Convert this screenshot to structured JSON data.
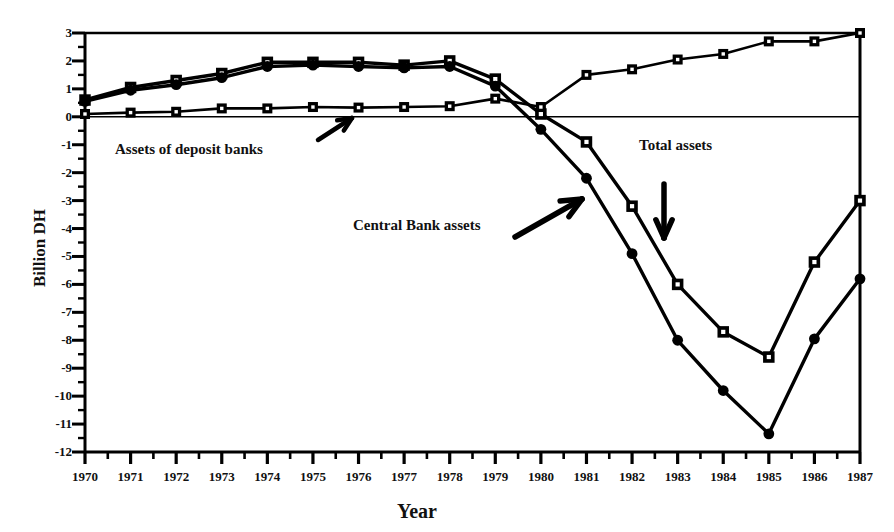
{
  "chart_data": {
    "type": "line",
    "title": "",
    "xlabel": "Year",
    "ylabel": "Billion DH",
    "xlim": [
      1970,
      1987
    ],
    "ylim": [
      -12,
      3
    ],
    "ytick_step": 1,
    "yminor_step": 0.5,
    "grid": false,
    "legend": "annotations-inline",
    "x": [
      1970,
      1971,
      1972,
      1973,
      1974,
      1975,
      1976,
      1977,
      1978,
      1979,
      1980,
      1981,
      1982,
      1983,
      1984,
      1985,
      1986,
      1987
    ],
    "ytick_labels": [
      "3",
      "2",
      "1",
      "0",
      "-1",
      "-2",
      "-3",
      "-4",
      "-5",
      "-6",
      "-7",
      "-8",
      "-9",
      "-10",
      "-11",
      "-12"
    ],
    "xtick_labels": [
      "1970",
      "1971",
      "1972",
      "1973",
      "1974",
      "1975",
      "1976",
      "1977",
      "1978",
      "1979",
      "1980",
      "1981",
      "1982",
      "1983",
      "1984",
      "1985",
      "1986",
      "1987"
    ],
    "series": [
      {
        "name": "Total assets",
        "marker": "open-square",
        "values": [
          0.6,
          1.05,
          1.3,
          1.55,
          1.95,
          1.95,
          1.95,
          1.85,
          2.0,
          1.35,
          0.1,
          -0.9,
          -3.2,
          -6.0,
          -7.7,
          -8.6,
          -5.2,
          -3.0
        ]
      },
      {
        "name": "Central Bank assets",
        "marker": "filled-circle",
        "values": [
          0.55,
          0.95,
          1.15,
          1.4,
          1.8,
          1.85,
          1.8,
          1.75,
          1.8,
          1.1,
          -0.45,
          -2.2,
          -4.9,
          -8.0,
          -9.8,
          -11.35,
          -7.95,
          -5.8
        ]
      },
      {
        "name": "Assets of deposit banks",
        "marker": "small-square",
        "values": [
          0.1,
          0.15,
          0.18,
          0.3,
          0.3,
          0.35,
          0.33,
          0.35,
          0.38,
          0.65,
          0.35,
          1.5,
          1.7,
          2.05,
          2.25,
          2.7,
          2.7,
          3.0
        ]
      }
    ],
    "annotations": [
      {
        "text": "Assets of deposit banks",
        "x_px": 115,
        "y_px": 141,
        "arrow": "up-right"
      },
      {
        "text": "Central Bank assets",
        "x_px": 353,
        "y_px": 217,
        "arrow": "up-right"
      },
      {
        "text": "Total assets",
        "x_px": 639,
        "y_px": 137,
        "arrow": "down"
      }
    ]
  },
  "colors": {
    "ink": "#000000",
    "background": "#ffffff"
  }
}
